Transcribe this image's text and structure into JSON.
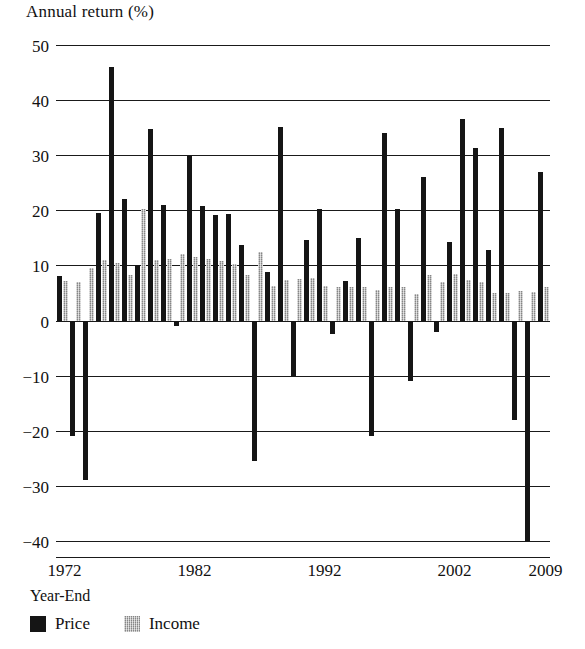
{
  "chart_data": {
    "type": "bar",
    "title": "",
    "ylabel": "Annual return (%)",
    "xlabel": "Year-End",
    "ylim": [
      -40,
      50
    ],
    "y_ticks": [
      50,
      40,
      30,
      20,
      10,
      0,
      -10,
      -20,
      -30,
      -40
    ],
    "y_tick_labels": [
      "50",
      "40",
      "30",
      "20",
      "10",
      "0",
      "−10",
      "−20",
      "−30",
      "−40"
    ],
    "x_tick_labels": [
      "1972",
      "1982",
      "1992",
      "2002",
      "2009"
    ],
    "x_tick_years": [
      1972,
      1982,
      1992,
      2002,
      2009
    ],
    "grid": true,
    "legend_position": "bottom-left",
    "categories": [
      "1972",
      "1973",
      "1974",
      "1975",
      "1976",
      "1977",
      "1978",
      "1979",
      "1980",
      "1981",
      "1982",
      "1983",
      "1984",
      "1985",
      "1986",
      "1987",
      "1988",
      "1989",
      "1990",
      "1991",
      "1992",
      "1993",
      "1994",
      "1995",
      "1996",
      "1997",
      "1998",
      "1999",
      "2000",
      "2001",
      "2002",
      "2003",
      "2004",
      "2005",
      "2006",
      "2007",
      "2008",
      "2009"
    ],
    "series": [
      {
        "name": "Price",
        "color": "#151515",
        "values": [
          8.0,
          -21.0,
          -29.0,
          19.5,
          46.0,
          22.0,
          10.0,
          34.8,
          21.0,
          -1.0,
          29.8,
          20.8,
          19.2,
          19.3,
          13.7,
          -25.5,
          8.8,
          35.2,
          -10.0,
          14.7,
          20.2,
          -2.5,
          7.2,
          15.0,
          -21.0,
          34.0,
          20.2,
          -11.0,
          26.0,
          -2.0,
          14.3,
          36.5,
          31.3,
          12.8,
          35.0,
          -18.0,
          -40.0,
          27.0
        ]
      },
      {
        "name": "Income",
        "color": "#a9a9a9",
        "values": [
          7.1,
          7.0,
          9.5,
          11.0,
          10.5,
          8.2,
          20.3,
          11.0,
          11.2,
          12.0,
          11.5,
          11.1,
          10.8,
          10.3,
          8.2,
          12.5,
          6.3,
          7.4,
          7.6,
          7.7,
          6.2,
          6.0,
          6.0,
          6.0,
          5.6,
          6.1,
          6.1,
          4.9,
          8.3,
          7.0,
          8.4,
          7.3,
          7.0,
          5.0,
          5.0,
          5.3,
          5.1,
          6.0
        ]
      }
    ]
  },
  "legend": {
    "items": [
      {
        "label": "Price",
        "swatch": "price"
      },
      {
        "label": "Income",
        "swatch": "income"
      }
    ]
  },
  "axis": {
    "y_title": "Annual return (%)",
    "x_title": "Year-End"
  }
}
